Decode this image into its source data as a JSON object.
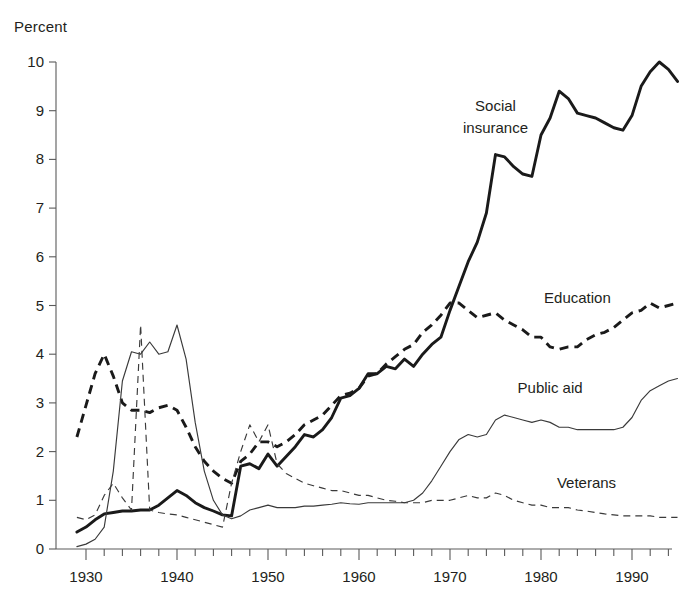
{
  "chart_data": {
    "type": "line",
    "title": "",
    "subtitle": "",
    "xlabel": "",
    "ylabel": "Percent",
    "ylim": [
      0,
      10
    ],
    "xlim": [
      1929,
      1995
    ],
    "grid": false,
    "legend_position": "inline-annotations",
    "yticks": [
      "0",
      "1",
      "2",
      "3",
      "4",
      "5",
      "6",
      "7",
      "8",
      "9",
      "10"
    ],
    "xticks": [
      "1930",
      "1940",
      "1950",
      "1960",
      "1970",
      "1980",
      "1990"
    ],
    "xtick_minor_interval": 2,
    "x": [
      1929,
      1930,
      1931,
      1932,
      1933,
      1934,
      1935,
      1936,
      1937,
      1938,
      1939,
      1940,
      1941,
      1942,
      1943,
      1944,
      1945,
      1946,
      1947,
      1948,
      1949,
      1950,
      1951,
      1952,
      1953,
      1954,
      1955,
      1956,
      1957,
      1958,
      1959,
      1960,
      1961,
      1962,
      1963,
      1964,
      1965,
      1966,
      1967,
      1968,
      1969,
      1970,
      1971,
      1972,
      1973,
      1974,
      1975,
      1976,
      1977,
      1978,
      1979,
      1980,
      1981,
      1982,
      1983,
      1984,
      1985,
      1986,
      1987,
      1988,
      1989,
      1990,
      1991,
      1992,
      1993,
      1994,
      1995
    ],
    "series": [
      {
        "name": "Social insurance",
        "style": "thick-solid",
        "color": "#1a1a1a",
        "label_x": 1975,
        "label_y": 9.0,
        "values": [
          0.35,
          0.45,
          0.6,
          0.72,
          0.75,
          0.78,
          0.78,
          0.8,
          0.8,
          0.9,
          1.05,
          1.2,
          1.1,
          0.95,
          0.85,
          0.78,
          0.7,
          0.68,
          1.7,
          1.75,
          1.65,
          1.95,
          1.7,
          1.9,
          2.1,
          2.35,
          2.3,
          2.45,
          2.7,
          3.1,
          3.15,
          3.3,
          3.6,
          3.6,
          3.75,
          3.7,
          3.9,
          3.75,
          4.0,
          4.2,
          4.35,
          4.9,
          5.4,
          5.9,
          6.3,
          6.9,
          8.1,
          8.05,
          7.85,
          7.7,
          7.65,
          8.5,
          8.85,
          9.4,
          9.25,
          8.95,
          8.9,
          8.85,
          8.75,
          8.65,
          8.6,
          8.9,
          9.5,
          9.8,
          10.0,
          9.85,
          9.6
        ]
      },
      {
        "name": "Education",
        "style": "thick-dash",
        "color": "#1a1a1a",
        "label_x": 1984,
        "label_y": 5.05,
        "values": [
          2.3,
          2.95,
          3.6,
          4.0,
          3.55,
          3.0,
          2.85,
          2.85,
          2.8,
          2.9,
          2.95,
          2.85,
          2.5,
          2.1,
          1.8,
          1.6,
          1.45,
          1.35,
          1.8,
          1.95,
          2.2,
          2.2,
          2.1,
          2.2,
          2.35,
          2.55,
          2.65,
          2.75,
          2.95,
          3.15,
          3.2,
          3.3,
          3.55,
          3.6,
          3.8,
          3.95,
          4.1,
          4.2,
          4.45,
          4.6,
          4.8,
          5.05,
          5.05,
          4.9,
          4.75,
          4.8,
          4.85,
          4.7,
          4.6,
          4.5,
          4.35,
          4.35,
          4.15,
          4.1,
          4.15,
          4.15,
          4.3,
          4.4,
          4.45,
          4.55,
          4.7,
          4.85,
          4.9,
          5.05,
          4.95,
          5.0,
          5.05
        ]
      },
      {
        "name": "Public aid",
        "style": "thin-solid",
        "color": "#3a3a3a",
        "label_x": 1981,
        "label_y": 3.2,
        "values": [
          0.05,
          0.1,
          0.2,
          0.45,
          1.6,
          3.45,
          4.05,
          4.0,
          4.25,
          4.0,
          4.05,
          4.6,
          3.9,
          2.6,
          1.6,
          1.0,
          0.7,
          0.62,
          0.68,
          0.8,
          0.85,
          0.9,
          0.85,
          0.85,
          0.85,
          0.88,
          0.88,
          0.9,
          0.92,
          0.95,
          0.93,
          0.92,
          0.95,
          0.95,
          0.95,
          0.95,
          0.95,
          1.0,
          1.15,
          1.4,
          1.7,
          2.0,
          2.25,
          2.35,
          2.3,
          2.35,
          2.65,
          2.75,
          2.7,
          2.65,
          2.6,
          2.65,
          2.6,
          2.5,
          2.5,
          2.45,
          2.45,
          2.45,
          2.45,
          2.45,
          2.5,
          2.7,
          3.05,
          3.25,
          3.35,
          3.45,
          3.5
        ]
      },
      {
        "name": "Veterans",
        "style": "thin-dash",
        "color": "#3a3a3a",
        "label_x": 1985,
        "label_y": 1.25,
        "values": [
          0.65,
          0.6,
          0.7,
          1.1,
          1.35,
          1.05,
          0.8,
          4.6,
          0.8,
          0.75,
          0.72,
          0.7,
          0.65,
          0.6,
          0.55,
          0.5,
          0.45,
          1.35,
          2.0,
          2.55,
          2.2,
          2.55,
          1.75,
          1.55,
          1.45,
          1.35,
          1.3,
          1.25,
          1.2,
          1.2,
          1.15,
          1.1,
          1.1,
          1.05,
          1.0,
          0.98,
          0.95,
          0.95,
          0.95,
          1.0,
          1.0,
          1.0,
          1.05,
          1.1,
          1.05,
          1.05,
          1.15,
          1.1,
          1.0,
          0.95,
          0.9,
          0.9,
          0.85,
          0.85,
          0.85,
          0.8,
          0.78,
          0.75,
          0.72,
          0.7,
          0.68,
          0.68,
          0.68,
          0.68,
          0.65,
          0.65,
          0.65
        ]
      }
    ]
  }
}
